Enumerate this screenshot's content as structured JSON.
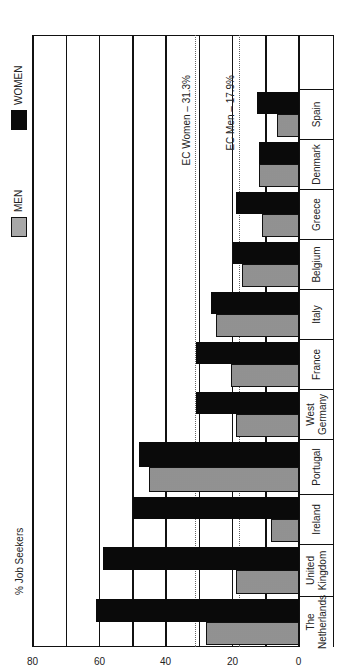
{
  "chart_data": {
    "type": "bar",
    "orientation": "vertical bars (image rotated 90° counter-clockwise)",
    "title": "",
    "ylabel": "% Job Seekers",
    "xlabel": "",
    "ylim": [
      0,
      80
    ],
    "yticks": [
      0,
      20,
      40,
      60,
      80
    ],
    "gridlines": [
      0,
      10,
      20,
      30,
      40,
      50,
      60,
      70,
      80
    ],
    "categories": [
      "The Netherlands",
      "United Kingdom",
      "Ireland",
      "Portugal",
      "West Germany",
      "France",
      "Italy",
      "Belgium",
      "Greece",
      "Denmark",
      "Spain"
    ],
    "series": [
      {
        "name": "WOMEN",
        "color": "#0a0a0a",
        "values": [
          61,
          59,
          50,
          48,
          31,
          31,
          26.5,
          20,
          19,
          12,
          12.5
        ]
      },
      {
        "name": "MEN",
        "color": "#a8a8a8",
        "values": [
          28,
          19,
          8.5,
          45,
          19,
          20.5,
          25,
          17,
          11,
          12,
          6.5
        ]
      }
    ],
    "reference_lines": [
      {
        "label": "EC Women – 31.3%",
        "value": 31.3
      },
      {
        "label": "EC Men – 17.9%",
        "value": 17.9
      }
    ],
    "legend": {
      "position": "top",
      "entries": [
        "MEN",
        "WOMEN"
      ]
    }
  },
  "legend": {
    "men_label": "MEN",
    "women_label": "WOMEN"
  },
  "axis": {
    "title": "% Job Seekers",
    "ticks": [
      "0",
      "20",
      "40",
      "60",
      "80"
    ]
  },
  "refs": {
    "women_label": "EC Women – 31.3%",
    "men_label": "EC Men – 17.9%"
  },
  "categories": [
    {
      "line1": "The",
      "line2": "Netherlands"
    },
    {
      "line1": "United",
      "line2": "Kingdom"
    },
    {
      "line1": "Ireland",
      "line2": ""
    },
    {
      "line1": "Portugal",
      "line2": ""
    },
    {
      "line1": "West",
      "line2": "Germany"
    },
    {
      "line1": "France",
      "line2": ""
    },
    {
      "line1": "Italy",
      "line2": ""
    },
    {
      "line1": "Belgium",
      "line2": ""
    },
    {
      "line1": "Greece",
      "line2": ""
    },
    {
      "line1": "Denmark",
      "line2": ""
    },
    {
      "line1": "Spain",
      "line2": ""
    }
  ]
}
